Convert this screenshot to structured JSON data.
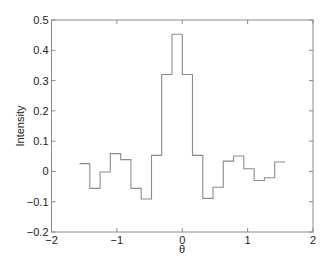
{
  "chart_data": {
    "type": "line",
    "style": "stairs",
    "title": "",
    "xlabel": "θ",
    "ylabel": "Intensity",
    "xlim": [
      -2,
      2
    ],
    "ylim": [
      -0.2,
      0.5
    ],
    "xticks": [
      -2,
      -1,
      0,
      1,
      2
    ],
    "xtick_labels": [
      "−2",
      "−1",
      "0",
      "1",
      "2"
    ],
    "yticks": [
      -0.2,
      -0.1,
      0,
      0.1,
      0.2,
      0.3,
      0.4,
      0.5
    ],
    "ytick_labels": [
      "−0.2",
      "−0.1",
      "0",
      "0.1",
      "0.2",
      "0.3",
      "0.4",
      "0.5"
    ],
    "grid": false,
    "legend": null,
    "series": [
      {
        "name": "Intensity",
        "color": "#8c8c8c",
        "bin_edges": [
          -1.571,
          -1.414,
          -1.257,
          -1.1,
          -0.942,
          -0.785,
          -0.628,
          -0.471,
          -0.314,
          -0.157,
          0.0,
          0.157,
          0.314,
          0.471,
          0.628,
          0.785,
          0.942,
          1.1,
          1.257,
          1.414,
          1.571
        ],
        "values": [
          0.026,
          -0.056,
          -0.002,
          0.059,
          0.039,
          -0.056,
          -0.091,
          0.053,
          0.32,
          0.453,
          0.32,
          0.053,
          -0.089,
          -0.052,
          0.034,
          0.051,
          0.009,
          -0.03,
          -0.021,
          0.031
        ]
      }
    ]
  },
  "colors": {
    "axis": "#8a8a8a",
    "line": "#8c8c8c",
    "text": "#222222",
    "background": "#ffffff"
  }
}
